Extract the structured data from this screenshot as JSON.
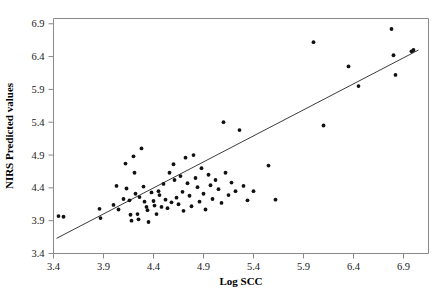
{
  "chart_data": {
    "type": "scatter",
    "title": "",
    "xlabel": "Log SCC",
    "ylabel": "NIRS Predicted values",
    "xlim": [
      3.4,
      7.15
    ],
    "ylim": [
      3.4,
      6.98
    ],
    "xticks": [
      3.4,
      3.9,
      4.4,
      4.9,
      5.4,
      5.9,
      6.4,
      6.9
    ],
    "xticklabels": [
      "3.4",
      "3.9",
      "4.4",
      "4.9",
      "5.4",
      "5.9",
      "6.4",
      "6.9"
    ],
    "yticks": [
      3.4,
      3.9,
      4.4,
      4.9,
      5.4,
      5.9,
      6.4,
      6.9
    ],
    "yticklabels": [
      "3.4",
      "3.9",
      "4.4",
      "4.9",
      "5.4",
      "5.9",
      "6.4",
      "6.9"
    ],
    "grid": false,
    "legend": null,
    "marker": "filled-circle",
    "marker_color": "#111111",
    "series": [
      {
        "name": "NIRS predicted vs Log SCC",
        "points": [
          [
            3.45,
            3.97
          ],
          [
            3.5,
            3.96
          ],
          [
            3.86,
            4.08
          ],
          [
            3.87,
            3.94
          ],
          [
            4.0,
            4.14
          ],
          [
            4.03,
            4.43
          ],
          [
            4.05,
            4.07
          ],
          [
            4.1,
            4.23
          ],
          [
            4.12,
            4.77
          ],
          [
            4.13,
            4.39
          ],
          [
            4.16,
            4.21
          ],
          [
            4.17,
            3.99
          ],
          [
            4.18,
            3.9
          ],
          [
            4.2,
            4.88
          ],
          [
            4.21,
            4.63
          ],
          [
            4.22,
            4.31
          ],
          [
            4.24,
            4.0
          ],
          [
            4.25,
            3.92
          ],
          [
            4.26,
            4.26
          ],
          [
            4.28,
            5.0
          ],
          [
            4.3,
            4.42
          ],
          [
            4.31,
            4.19
          ],
          [
            4.33,
            4.11
          ],
          [
            4.34,
            4.06
          ],
          [
            4.35,
            3.88
          ],
          [
            4.38,
            4.33
          ],
          [
            4.4,
            4.2
          ],
          [
            4.41,
            4.13
          ],
          [
            4.43,
            4.0
          ],
          [
            4.45,
            4.35
          ],
          [
            4.46,
            4.29
          ],
          [
            4.48,
            4.11
          ],
          [
            4.5,
            4.46
          ],
          [
            4.52,
            4.22
          ],
          [
            4.54,
            4.09
          ],
          [
            4.56,
            4.63
          ],
          [
            4.58,
            4.18
          ],
          [
            4.6,
            4.76
          ],
          [
            4.61,
            4.52
          ],
          [
            4.63,
            4.25
          ],
          [
            4.65,
            4.15
          ],
          [
            4.67,
            4.58
          ],
          [
            4.69,
            4.34
          ],
          [
            4.7,
            4.05
          ],
          [
            4.72,
            4.86
          ],
          [
            4.74,
            4.47
          ],
          [
            4.76,
            4.28
          ],
          [
            4.78,
            4.12
          ],
          [
            4.8,
            4.9
          ],
          [
            4.82,
            4.55
          ],
          [
            4.84,
            4.41
          ],
          [
            4.86,
            4.19
          ],
          [
            4.88,
            4.7
          ],
          [
            4.9,
            4.31
          ],
          [
            4.92,
            4.07
          ],
          [
            4.95,
            4.6
          ],
          [
            4.97,
            4.44
          ],
          [
            4.99,
            4.23
          ],
          [
            5.02,
            4.52
          ],
          [
            5.05,
            4.38
          ],
          [
            5.08,
            4.17
          ],
          [
            5.1,
            5.4
          ],
          [
            5.12,
            4.63
          ],
          [
            5.15,
            4.29
          ],
          [
            5.18,
            4.48
          ],
          [
            5.22,
            4.35
          ],
          [
            5.26,
            5.28
          ],
          [
            5.3,
            4.43
          ],
          [
            5.34,
            4.21
          ],
          [
            5.4,
            4.35
          ],
          [
            5.55,
            4.74
          ],
          [
            5.62,
            4.22
          ],
          [
            6.0,
            6.62
          ],
          [
            6.1,
            5.35
          ],
          [
            6.35,
            6.25
          ],
          [
            6.45,
            5.95
          ],
          [
            6.78,
            6.82
          ],
          [
            6.8,
            6.42
          ],
          [
            6.82,
            6.12
          ],
          [
            6.98,
            6.48
          ],
          [
            7.0,
            6.5
          ]
        ]
      }
    ],
    "trendline": {
      "name": "regression-line",
      "x_start": 3.43,
      "y_start": 3.63,
      "x_end": 7.05,
      "y_end": 6.5,
      "color": "#3c3c3c"
    }
  }
}
